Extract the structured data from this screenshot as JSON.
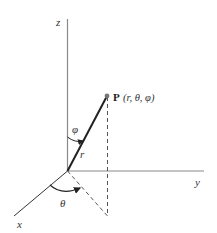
{
  "diagram": {
    "axes": {
      "x_label": "x",
      "y_label": "y",
      "z_label": "z"
    },
    "point": {
      "name": "P",
      "coords_label": "(r, θ, φ)"
    },
    "labels": {
      "radius": "r",
      "polar_angle": "φ",
      "azimuth_angle": "θ"
    },
    "colors": {
      "axis": "#8a8a8a",
      "radius_line": "#222222",
      "dashed": "#555555",
      "point": "#777777",
      "arc": "#222222"
    }
  }
}
